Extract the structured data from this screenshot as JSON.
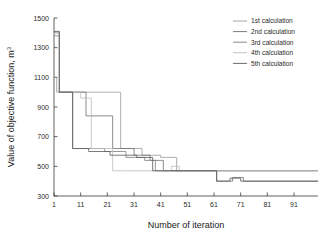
{
  "chart_data": {
    "type": "line",
    "title": "",
    "xlabel": "Number of iteration",
    "ylabel": "Value of objective function, m",
    "ylabel_sup": "3",
    "xlim": [
      1,
      100
    ],
    "ylim": [
      300,
      1500
    ],
    "xticks": [
      1,
      11,
      21,
      31,
      41,
      51,
      61,
      71,
      81,
      91
    ],
    "yticks": [
      300,
      500,
      700,
      900,
      1100,
      1300,
      1500
    ],
    "grid": false,
    "legend_position": "top-right",
    "step_style": "post",
    "series": [
      {
        "name": "1st calculation",
        "color": "#9a9a9a",
        "x": [
          1,
          2,
          3,
          9,
          10,
          20,
          21,
          25,
          26,
          33,
          34,
          40,
          41,
          46,
          47,
          100
        ],
        "values": [
          1100,
          1000,
          1000,
          1000,
          1000,
          1000,
          1000,
          1000,
          620,
          620,
          575,
          575,
          560,
          560,
          470,
          470
        ]
      },
      {
        "name": "2nd calculation",
        "color": "#6e6e6e",
        "x": [
          1,
          2,
          3,
          8,
          9,
          12,
          13,
          22,
          23,
          30,
          31,
          36,
          37,
          41,
          42,
          61,
          62,
          67,
          68,
          71,
          72,
          78,
          79,
          100
        ],
        "values": [
          1405,
          1405,
          1000,
          1000,
          1000,
          1000,
          840,
          840,
          620,
          620,
          575,
          575,
          540,
          540,
          470,
          470,
          400,
          400,
          425,
          425,
          400,
          400,
          400,
          400
        ]
      },
      {
        "name": "3rd calculation",
        "color": "#7e7e7e",
        "x": [
          1,
          2,
          3,
          7,
          8,
          11,
          12,
          19,
          20,
          27,
          28,
          34,
          35,
          38,
          39,
          100
        ],
        "values": [
          1380,
          1380,
          1000,
          1000,
          620,
          620,
          620,
          620,
          600,
          600,
          560,
          560,
          540,
          540,
          470,
          470
        ]
      },
      {
        "name": "4th calculation",
        "color": "#bdbdbd",
        "x": [
          1,
          2,
          3,
          10,
          11,
          14,
          15,
          22,
          23,
          26,
          27,
          44,
          45,
          47,
          48,
          100
        ],
        "values": [
          1395,
          1395,
          1000,
          1000,
          960,
          960,
          620,
          620,
          470,
          470,
          470,
          470,
          500,
          500,
          470,
          470
        ]
      },
      {
        "name": "5th calculation",
        "color": "#5a5a5a",
        "x": [
          1,
          2,
          3,
          7,
          8,
          13,
          14,
          21,
          22,
          31,
          32,
          37,
          38,
          61,
          62,
          66,
          67,
          70,
          71,
          76,
          77,
          100
        ],
        "values": [
          1410,
          1410,
          1000,
          1000,
          620,
          620,
          600,
          600,
          575,
          575,
          560,
          560,
          470,
          470,
          400,
          400,
          420,
          420,
          400,
          400,
          400,
          400
        ]
      }
    ]
  },
  "legend": {
    "items": [
      {
        "label": "1st calculation"
      },
      {
        "label": "2nd calculation"
      },
      {
        "label": "3rd calculation"
      },
      {
        "label": "4th calculation"
      },
      {
        "label": "5th calculation"
      }
    ]
  }
}
